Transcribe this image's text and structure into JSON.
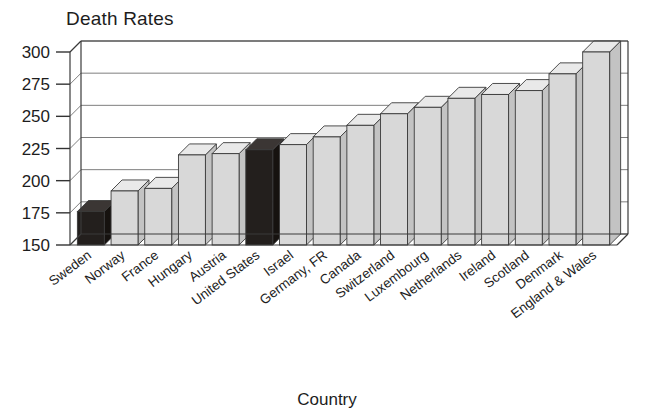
{
  "chart_data": {
    "type": "bar",
    "title": "Death Rates",
    "xlabel": "Country",
    "ylabel": "",
    "ylim": [
      150,
      300
    ],
    "yticks": [
      150,
      175,
      200,
      225,
      250,
      275,
      300
    ],
    "grid": true,
    "legend": "none",
    "style": "3d-perspective-bars",
    "highlight_color": "#231f1d",
    "bar_color": "#d8d8d8",
    "categories": [
      "Sweden",
      "Norway",
      "France",
      "Hungary",
      "Austria",
      "United States",
      "Israel",
      "Germany, FR",
      "Canada",
      "Switzerland",
      "Luxembourg",
      "Netherlands",
      "Ireland",
      "Scotland",
      "Denmark",
      "England & Wales"
    ],
    "values": [
      176,
      192,
      194,
      220,
      221,
      224,
      228,
      234,
      243,
      252,
      257,
      264,
      267,
      270,
      283,
      300
    ],
    "highlighted": [
      "Sweden",
      "United States"
    ]
  },
  "axis": {
    "y_tick_labels": [
      "300",
      "275",
      "250",
      "225",
      "200",
      "175",
      "150"
    ],
    "x_axis_title": "Country"
  }
}
